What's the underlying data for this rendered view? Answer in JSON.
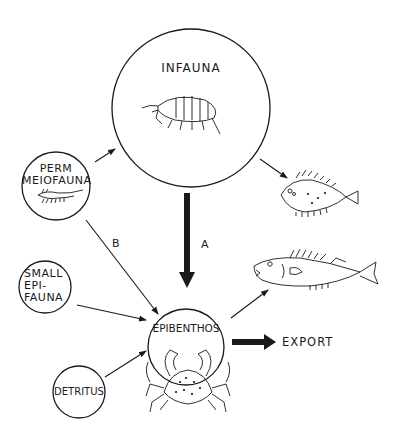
{
  "diagram": {
    "nodes": {
      "infauna": {
        "label": "INFAUNA",
        "icon": "amphipod-icon"
      },
      "perm_meiofauna": {
        "label_line1": "PERM",
        "label_line2": "MEIOFAUNA",
        "icon": "copepod-icon"
      },
      "small_epifauna": {
        "label_line1": "SMALL",
        "label_line2": "EPI-",
        "label_line3": "FAUNA"
      },
      "detritus": {
        "label": "DETRITUS"
      },
      "epibenthos": {
        "label": "EPIBENTHOS",
        "icon": "crab-icon"
      },
      "flatfish": {
        "icon": "flatfish-icon"
      },
      "roundfish": {
        "icon": "roundfish-icon"
      },
      "export": {
        "label": "EXPORT"
      }
    },
    "edges": {
      "a": {
        "label": "A",
        "from": "INFAUNA",
        "to": "EPIBENTHOS",
        "style": "thick"
      },
      "b": {
        "label": "B",
        "from": "PERM MEIOFAUNA",
        "to": "EPIBENTHOS",
        "style": "thin"
      },
      "meio_to_infauna": {
        "from": "PERM MEIOFAUNA",
        "to": "INFAUNA"
      },
      "infauna_to_flatfish": {
        "from": "INFAUNA",
        "to": "flatfish"
      },
      "epifauna_to_epibenthos": {
        "from": "SMALL EPIFAUNA",
        "to": "EPIBENTHOS"
      },
      "detritus_to_epibenthos": {
        "from": "DETRITUS",
        "to": "EPIBENTHOS"
      },
      "epibenthos_to_roundfish": {
        "from": "EPIBENTHOS",
        "to": "roundfish"
      },
      "epibenthos_to_export": {
        "from": "EPIBENTHOS",
        "to": "EXPORT",
        "style": "thick"
      }
    },
    "colors": {
      "ink": "#1a1a1a",
      "background": "#ffffff"
    }
  }
}
